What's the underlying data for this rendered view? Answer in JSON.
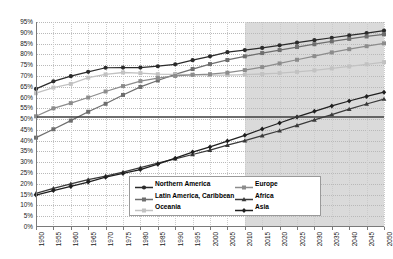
{
  "chart_data": {
    "type": "line",
    "title": "",
    "subtitle": "",
    "xlabel": "",
    "ylabel": "",
    "grid": "horizontal-dotted",
    "legend_position": "inside-bottom-center",
    "xlim": [
      1950,
      2050
    ],
    "ylim": [
      0,
      95
    ],
    "ytick_step": 5,
    "xtick_step": 5,
    "forecast_start": 2010,
    "forecast_label": "projection",
    "x": [
      1950,
      1955,
      1960,
      1965,
      1970,
      1975,
      1980,
      1985,
      1990,
      1995,
      2000,
      2005,
      2010,
      2015,
      2020,
      2025,
      2030,
      2035,
      2040,
      2045,
      2050
    ],
    "ytick_labels": [
      "0%",
      "5%",
      "10%",
      "15%",
      "20%",
      "25%",
      "30%",
      "35%",
      "40%",
      "45%",
      "50%",
      "55%",
      "60%",
      "65%",
      "70%",
      "75%",
      "80%",
      "85%",
      "90%",
      "95%"
    ],
    "xtick_labels": [
      "1950",
      "1955",
      "1960",
      "1965",
      "1970",
      "1975",
      "1980",
      "1985",
      "1990",
      "1995",
      "2000",
      "2005",
      "2010",
      "2015",
      "2020",
      "2025",
      "2030",
      "2035",
      "2040",
      "2045",
      "2050"
    ],
    "series": [
      {
        "name": "Northern America",
        "color": "#2b2b2b",
        "marker": "circle",
        "values": [
          64.0,
          67.5,
          69.9,
          71.9,
          73.8,
          73.9,
          73.9,
          74.5,
          75.4,
          77.3,
          79.1,
          81.0,
          82.0,
          83.0,
          84.2,
          85.4,
          86.6,
          87.7,
          88.8,
          89.9,
          91.0
        ]
      },
      {
        "name": "Latin America, Caribbean",
        "color": "#6e6e6e",
        "marker": "square",
        "values": [
          41.4,
          45.3,
          49.3,
          53.4,
          57.1,
          61.2,
          64.9,
          67.9,
          70.7,
          73.2,
          75.5,
          77.4,
          79.1,
          80.6,
          82.0,
          83.4,
          84.7,
          86.0,
          87.2,
          88.3,
          89.3
        ]
      },
      {
        "name": "Oceania",
        "color": "#c2c2c2",
        "marker": "square",
        "values": [
          62.0,
          64.6,
          66.3,
          69.2,
          70.7,
          71.6,
          71.3,
          70.8,
          70.7,
          70.6,
          70.4,
          70.4,
          70.6,
          70.9,
          71.3,
          71.9,
          72.6,
          73.5,
          74.4,
          75.4,
          76.4
        ]
      },
      {
        "name": "Europe",
        "color": "#8c8c8c",
        "marker": "square",
        "values": [
          51.3,
          55.0,
          57.4,
          60.0,
          62.8,
          65.3,
          67.6,
          69.0,
          70.0,
          70.5,
          70.8,
          71.5,
          72.7,
          74.1,
          75.8,
          77.5,
          79.2,
          80.9,
          82.4,
          83.8,
          85.1
        ]
      },
      {
        "name": "Africa",
        "color": "#3a3a3a",
        "marker": "triangle",
        "values": [
          15.6,
          17.9,
          20.0,
          22.0,
          23.6,
          25.4,
          27.5,
          29.6,
          31.6,
          33.6,
          35.6,
          37.9,
          40.0,
          42.3,
          44.6,
          47.1,
          49.6,
          52.1,
          54.6,
          57.0,
          59.3
        ]
      },
      {
        "name": "Asia",
        "color": "#1f1f1f",
        "marker": "diamond",
        "values": [
          14.8,
          16.9,
          18.8,
          20.8,
          23.1,
          24.8,
          26.6,
          29.1,
          31.9,
          34.7,
          37.1,
          39.8,
          42.5,
          45.4,
          48.2,
          51.0,
          53.6,
          56.1,
          58.4,
          60.5,
          62.5
        ]
      }
    ],
    "reference_line": {
      "name": "fifty-percent-line",
      "value": 51,
      "color": "#3d3d3d"
    }
  },
  "legend": {
    "left_items": [
      {
        "label": "Northern America"
      },
      {
        "label": "Latin America, Caribbean"
      },
      {
        "label": "Oceania"
      }
    ],
    "right_items": [
      {
        "label": "Europe"
      },
      {
        "label": "Africa"
      },
      {
        "label": "Asia"
      }
    ]
  }
}
